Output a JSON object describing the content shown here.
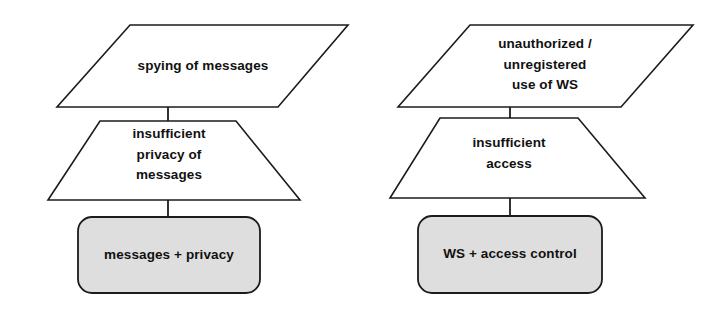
{
  "diagram": {
    "kind": "misuse-case-diagram",
    "background_color": "#ffffff",
    "stroke_color": "#1b1b1b",
    "fill_color": "#dedede",
    "columns": [
      {
        "name": "messages-privacy-column",
        "threat": {
          "shape": "parallelogram",
          "label": "spying of messages"
        },
        "vulnerability": {
          "shape": "trapezoid",
          "label": "insufficient\nprivacy of\nmessages"
        },
        "asset": {
          "shape": "rounded-rectangle",
          "label": "messages + privacy"
        }
      },
      {
        "name": "ws-access-control-column",
        "threat": {
          "shape": "parallelogram",
          "label": "unauthorized /\nunregistered\nuse of WS"
        },
        "vulnerability": {
          "shape": "trapezoid",
          "label": "insufficient\naccess"
        },
        "asset": {
          "shape": "rounded-rectangle",
          "label": "WS + access control"
        }
      }
    ]
  }
}
